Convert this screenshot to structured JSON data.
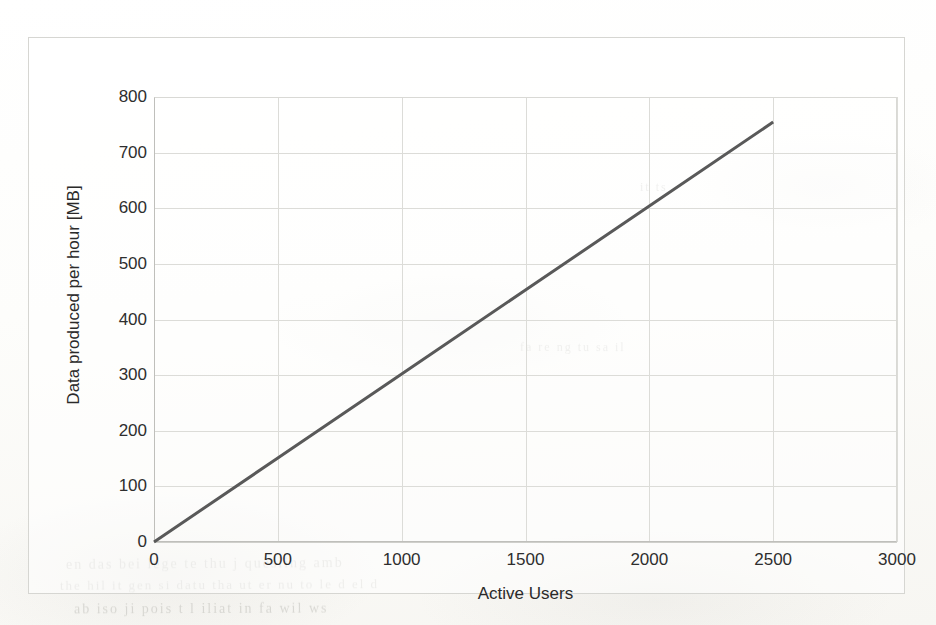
{
  "chart_data": {
    "type": "line",
    "title": "",
    "xlabel": "Active Users",
    "ylabel": "Data produced per hour [MB]",
    "xlim": [
      0,
      3000
    ],
    "ylim": [
      0,
      800
    ],
    "xticks": [
      "0",
      "500",
      "1000",
      "1500",
      "2000",
      "2500",
      "3000"
    ],
    "xtick_values": [
      0,
      500,
      1000,
      1500,
      2000,
      2500,
      3000
    ],
    "yticks": [
      "0",
      "100",
      "200",
      "300",
      "400",
      "500",
      "600",
      "700",
      "800"
    ],
    "ytick_values": [
      0,
      100,
      200,
      300,
      400,
      500,
      600,
      700,
      800
    ],
    "grid": true,
    "legend": "none",
    "series": [
      {
        "name": "Data produced per hour",
        "color": "#595959",
        "linewidth": 3,
        "x": [
          0,
          500,
          1000,
          1500,
          2000,
          2500
        ],
        "values": [
          0,
          151,
          302,
          453,
          604,
          755
        ]
      }
    ],
    "annotations": []
  },
  "axes": {
    "x_title": "Active Users",
    "y_title": "Data produced per hour [MB]"
  },
  "style": {
    "line_color": "#595959",
    "grid_color": "#dcdcd8",
    "axis_color": "#bfbfbb",
    "text_color": "#2e2e2e",
    "page_background": "#fbfbf9"
  },
  "page_bleed": [
    {
      "text": "en das  bei lege  te  thu  j  quesiing  amb",
      "left": 66,
      "top": 556,
      "size": 14,
      "rotate": -0.4
    },
    {
      "text": "ab  iso ji  pois    t    l iliat in  fa wil ws",
      "left": 74,
      "top": 601,
      "size": 14,
      "rotate": -0.2
    },
    {
      "text": "the  hil  it  gen  si  datu  tha  ut  er  nu  to  le  d el  d",
      "left": 60,
      "top": 577,
      "size": 13,
      "rotate": -0.3
    },
    {
      "text": "fa  re  ng  tu  sa  il",
      "left": 520,
      "top": 340,
      "size": 12,
      "rotate": 0.2
    },
    {
      "text": "it  ts",
      "left": 640,
      "top": 180,
      "size": 12,
      "rotate": 0.1
    }
  ]
}
